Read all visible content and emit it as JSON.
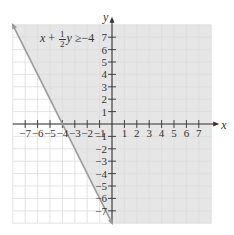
{
  "chart_data": {
    "type": "line",
    "title": "",
    "annotation": {
      "text": "x + 1/2 y ≥ -4",
      "lhs_var1": "x",
      "plus": "+",
      "frac_num": "1",
      "frac_den": "2",
      "lhs_var2": "y",
      "relation": "≥",
      "rhs": "−4"
    },
    "xlabel": "x",
    "ylabel": "y",
    "xlim": [
      -8,
      8
    ],
    "ylim": [
      -8,
      8
    ],
    "grid": true,
    "x_ticks": [
      -7,
      -6,
      -5,
      -4,
      -3,
      -2,
      -1,
      1,
      2,
      3,
      4,
      5,
      6,
      7
    ],
    "y_ticks": [
      -7,
      -6,
      -5,
      -4,
      -3,
      -2,
      -1,
      1,
      2,
      3,
      4,
      5,
      6,
      7
    ],
    "x_tick_labels": [
      "−7",
      "−6",
      "−5",
      "−4",
      "−3",
      "−2",
      "−1",
      "1",
      "2",
      "3",
      "4",
      "5",
      "6",
      "7"
    ],
    "y_tick_labels": [
      "−7",
      "−6",
      "−5",
      "−4",
      "−3",
      "−2",
      "−1",
      "1",
      "2",
      "3",
      "4",
      "5",
      "6",
      "7"
    ],
    "series": [
      {
        "name": "boundary x + (1/2)y = -4",
        "style": "solid",
        "points": [
          [
            -8,
            8
          ],
          [
            0,
            -8
          ]
        ]
      }
    ],
    "shaded_region": {
      "description": "half-plane to the right of the boundary line (x + y/2 >= -4)",
      "color": "#e6e6e6"
    },
    "colors": {
      "line": "#9a9a9a",
      "grid": "#dcdcdc",
      "axis": "#333333"
    }
  }
}
